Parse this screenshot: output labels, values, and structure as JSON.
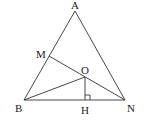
{
  "diagram": {
    "type": "geometry",
    "points": {
      "A": {
        "label": "A",
        "x": 75,
        "y": 11
      },
      "B": {
        "label": "B",
        "x": 24,
        "y": 100
      },
      "N": {
        "label": "N",
        "x": 125,
        "y": 100
      },
      "M": {
        "label": "M",
        "x": 49,
        "y": 56
      },
      "O": {
        "label": "O",
        "x": 85,
        "y": 77
      },
      "H": {
        "label": "H",
        "x": 85,
        "y": 100
      }
    },
    "segments": [
      "AB",
      "AN",
      "BN",
      "MN",
      "BO",
      "OH"
    ],
    "right_angle": "OHN"
  }
}
